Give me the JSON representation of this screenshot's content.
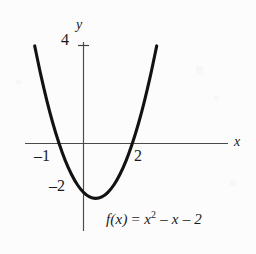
{
  "figure": {
    "background_color": "#fcfcfc",
    "curve_color": "#121212",
    "axis_color": "#4a4a4a",
    "text_color": "#1a1a1a"
  },
  "axes": {
    "x_axis_label": "x",
    "y_axis_label": "y",
    "x_tick_labels": [
      "–1",
      "2"
    ],
    "y_tick_labels": [
      "4",
      "–2"
    ]
  },
  "equation": {
    "lhs": "f(x)",
    "equals": "=",
    "term1_base": "x",
    "term1_exp": "2",
    "term2": "– x",
    "term3": "– 2",
    "full_text": "f(x) = x² – x – 2"
  },
  "chart_data": {
    "type": "line",
    "title": "",
    "subtitle": "",
    "xlabel": "x",
    "ylabel": "y",
    "function": "f(x) = x^2 - x - 2",
    "xlim": [
      -2.4,
      3.4
    ],
    "ylim": [
      -3.5,
      4.5
    ],
    "grid": false,
    "legend": "none",
    "xticks": [
      -1,
      2
    ],
    "xtick_labels": [
      "–1",
      "2"
    ],
    "yticks": [
      4,
      -2
    ],
    "ytick_labels": [
      "4",
      "–2"
    ],
    "roots": [
      -1,
      2
    ],
    "vertex": [
      0.5,
      -2.25
    ],
    "y_intercept": -2,
    "series": [
      {
        "name": "f(x) = x^2 - x - 2",
        "x": [
          -2.15,
          -2.0,
          -1.75,
          -1.5,
          -1.25,
          -1.0,
          -0.75,
          -0.5,
          -0.25,
          0.0,
          0.25,
          0.5,
          0.75,
          1.0,
          1.25,
          1.5,
          1.75,
          2.0,
          2.25,
          2.5,
          2.75,
          3.0,
          3.15
        ],
        "y": [
          4.77,
          4.0,
          2.81,
          1.75,
          0.81,
          0.0,
          -0.69,
          -1.25,
          -1.69,
          -2.0,
          -2.19,
          -2.25,
          -2.19,
          -2.0,
          -1.69,
          -1.25,
          -0.69,
          0.0,
          0.81,
          1.75,
          2.81,
          4.0,
          4.77
        ]
      }
    ]
  },
  "annotations": {
    "tick_4_value": "4",
    "tick_neg1_value": "–1",
    "tick_2_value": "2",
    "tick_neg2_value": "–2"
  }
}
